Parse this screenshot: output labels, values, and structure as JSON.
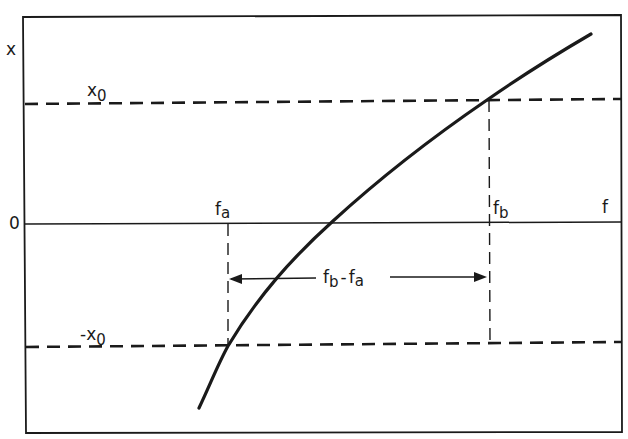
{
  "figure": {
    "type": "hysteresis-threshold-diagram",
    "axes": {
      "y_axis_label": "x",
      "x_axis_label": "f",
      "origin_label": "0"
    },
    "levels": {
      "upper_threshold": {
        "label": "x",
        "subscript": "0",
        "value": 1
      },
      "lower_threshold": {
        "label": "-x",
        "subscript": "0",
        "value": -1
      },
      "zero": 0
    },
    "frequencies": {
      "fa": {
        "label": "f",
        "subscript": "a"
      },
      "fb": {
        "label": "f",
        "subscript": "b"
      }
    },
    "difference_annotation": {
      "part1": "f",
      "sub1": "b",
      "dash": "-",
      "part2": "f",
      "sub2": "a"
    },
    "curve": {
      "description": "monotonically increasing, concave-down response curve",
      "points_normalized": [
        {
          "f": -0.11,
          "x": -1.5
        },
        {
          "f": 0.0,
          "x": -1.0
        },
        {
          "f": 0.4,
          "x": 0.0
        },
        {
          "f": 1.0,
          "x": 1.0
        },
        {
          "f": 1.4,
          "x": 1.55
        }
      ]
    },
    "colors": {
      "ink": "#1a1a1a",
      "background": "#ffffff"
    }
  }
}
